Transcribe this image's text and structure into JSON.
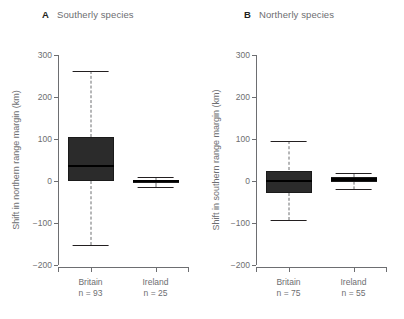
{
  "chart_data": [
    {
      "type": "box",
      "panel": "A",
      "title": "Southerly species",
      "xlabel": "",
      "ylabel": "Shift in northern range margin (km)",
      "ylim": [
        -200,
        300
      ],
      "yticks": [
        300,
        200,
        100,
        0,
        -100,
        -200
      ],
      "ytick_labels": [
        "300",
        "200",
        "100",
        "0",
        "-100",
        "-200"
      ],
      "grid": false,
      "legend": "none",
      "categories": [
        "Britain",
        "Ireland"
      ],
      "group_counts": [
        "n = 93",
        "n = 25"
      ],
      "boxes": [
        {
          "name": "Britain",
          "count": 93,
          "whisker_low": -152,
          "q1": 0,
          "median": 35,
          "q3": 105,
          "whisker_high": 262
        },
        {
          "name": "Ireland",
          "count": 25,
          "whisker_low": -14,
          "q1": -5,
          "median": 0,
          "q3": 3,
          "whisker_high": 10
        }
      ]
    },
    {
      "type": "box",
      "panel": "B",
      "title": "Northerly species",
      "xlabel": "",
      "ylabel": "Shift in southern range margin (km)",
      "ylim": [
        -200,
        300
      ],
      "yticks": [
        300,
        200,
        100,
        0,
        -100,
        -200
      ],
      "ytick_labels": [
        "300",
        "200",
        "100",
        "0",
        "-100",
        "-200"
      ],
      "grid": false,
      "legend": "none",
      "categories": [
        "Britain",
        "Ireland"
      ],
      "group_counts": [
        "n = 75",
        "n = 55"
      ],
      "boxes": [
        {
          "name": "Britain",
          "count": 75,
          "whisker_low": -93,
          "q1": -28,
          "median": 0,
          "q3": 25,
          "whisker_high": 95
        },
        {
          "name": "Ireland",
          "count": 55,
          "whisker_low": -20,
          "q1": -3,
          "median": 4,
          "q3": 9,
          "whisker_high": 19
        }
      ]
    }
  ],
  "panels": [
    {
      "letter": "A",
      "title": "Southerly species"
    },
    {
      "letter": "B",
      "title": "Northerly species"
    }
  ],
  "colors": {
    "background": "#ffffff",
    "text": "#6d6e71",
    "letter": "#231f20",
    "axis": "#6d6e71",
    "box_fill": "#2b2b2b",
    "median": "#000000",
    "whisker": "#6d6e71"
  }
}
